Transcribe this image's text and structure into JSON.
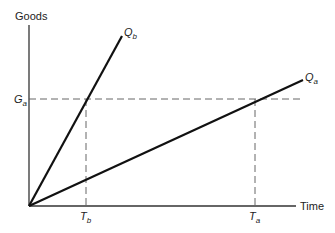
{
  "diagram": {
    "y_axis_label": "Goods",
    "x_axis_label": "Time",
    "lines": [
      {
        "name": "Q",
        "sub": "b",
        "from": [
          29,
          206
        ],
        "to": [
          122,
          36
        ]
      },
      {
        "name": "Q",
        "sub": "a",
        "from": [
          29,
          206
        ],
        "to": [
          303,
          80
        ]
      }
    ],
    "guides": {
      "g_level": {
        "name": "G",
        "sub": "a"
      },
      "t_b": {
        "name": "T",
        "sub": "b"
      },
      "t_a": {
        "name": "T",
        "sub": "a"
      }
    },
    "colors": {
      "line": "#111111",
      "axis": "#333333",
      "dash": "#555555",
      "text": "#222222"
    }
  }
}
